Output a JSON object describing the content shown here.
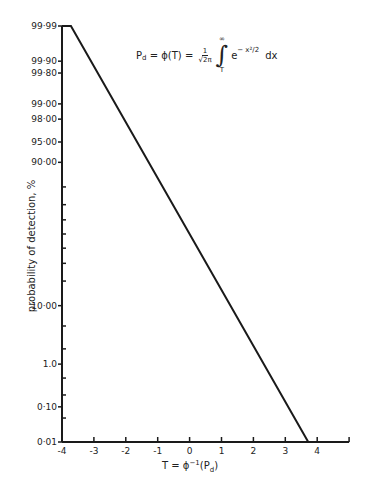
{
  "chart_data": {
    "type": "line",
    "title": "",
    "formula": {
      "lhs": "P",
      "lhs_sub": "d",
      "eq1": " = ϕ(T) = ",
      "frac_num": "1",
      "frac_den": "√2π",
      "int_upper": "∞",
      "int_lower": "T",
      "integrand_base": "e",
      "integrand_exp": "− x²/2",
      "dx": "dx"
    },
    "xlabel": "T = ϕ⁻¹(P_d)",
    "xlabel_parts": {
      "pre": "T = ϕ",
      "sup": "−1",
      "mid": "(P",
      "sub": "d",
      "post": ")"
    },
    "ylabel": "probability of detection, %",
    "y_scale": "probit (normal probability)",
    "xlim": [
      -4,
      5
    ],
    "ylim": [
      0.01,
      99.99
    ],
    "x_ticks": [
      -4,
      -3,
      -2,
      -1,
      0,
      1,
      2,
      3,
      4,
      5
    ],
    "x_tick_labels": [
      "-4",
      "-3",
      "-2",
      "-1",
      "0",
      "1",
      "2",
      "3",
      "4",
      ""
    ],
    "y_ticks_labeled": [
      {
        "value": 99.99,
        "label": "99·99"
      },
      {
        "value": 99.9,
        "label": "99·90"
      },
      {
        "value": 99.8,
        "label": "99·80"
      },
      {
        "value": 99.0,
        "label": "99·00"
      },
      {
        "value": 98.0,
        "label": "98·00"
      },
      {
        "value": 95.0,
        "label": "95·00"
      },
      {
        "value": 90.0,
        "label": "90·00"
      },
      {
        "value": 10.0,
        "label": "10·00"
      },
      {
        "value": 1.0,
        "label": "1.0"
      },
      {
        "value": 0.1,
        "label": "0·10"
      },
      {
        "value": 0.01,
        "label": "0·01"
      }
    ],
    "y_ticks_minor": [
      80,
      70,
      60,
      50,
      40,
      30,
      20,
      5,
      2,
      0.5,
      0.2,
      0.05
    ],
    "series": [
      {
        "name": "P_d vs T",
        "x": [
          -3.72,
          3.72
        ],
        "y": [
          99.99,
          0.01
        ]
      }
    ],
    "grid": false,
    "legend": null
  }
}
